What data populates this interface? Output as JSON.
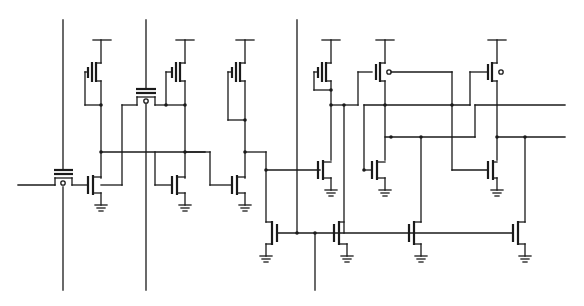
{
  "diagram": {
    "type": "transistor-level circuit schematic",
    "colors": {
      "background": "#ffffff",
      "ink": "#1a1a1a"
    },
    "signal_lines": [
      {
        "id": "in-left",
        "x1": 18,
        "y1": 185,
        "x2": 55,
        "y2": 185
      },
      {
        "id": "ctrl-1",
        "x": 63,
        "y1": 20,
        "y2": 290
      },
      {
        "id": "ctrl-2",
        "x": 146,
        "y1": 20,
        "y2": 290
      },
      {
        "id": "ctrl-3",
        "x": 297,
        "y1": 20,
        "y2": 233
      },
      {
        "id": "out-bottom",
        "x": 315,
        "y1": 233,
        "y2": 290
      },
      {
        "id": "out-right-1",
        "x1": 470,
        "y1": 105,
        "x2": 565,
        "y2": 105
      },
      {
        "id": "out-right-2",
        "x1": 497,
        "y1": 137,
        "x2": 565,
        "y2": 137
      }
    ],
    "supply_rails": [
      101,
      185,
      245,
      331,
      385,
      497
    ],
    "components": {
      "pass_gates": 2,
      "pmos_load_diode": 4,
      "pmos_bubble": 2,
      "nmos": 10,
      "ground_symbols": 10
    }
  }
}
